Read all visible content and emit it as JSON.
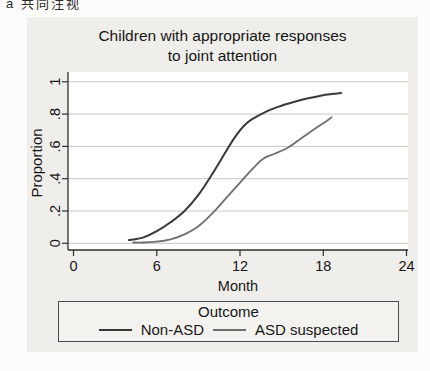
{
  "page": {
    "corner_label": "a 共同注视"
  },
  "figure": {
    "title_line1": "Children with appropriate responses",
    "title_line2": "to joint attention",
    "background": "#efeeea"
  },
  "chart_data": {
    "type": "line",
    "title": "Children with appropriate responses to joint attention",
    "xlabel": "Month",
    "ylabel": "Proportion",
    "xlim": [
      0,
      24
    ],
    "ylim": [
      0,
      1
    ],
    "x_ticks": [
      0,
      6,
      12,
      18,
      24
    ],
    "y_ticks": [
      0,
      0.2,
      0.4,
      0.6,
      0.8,
      1
    ],
    "y_tick_labels": [
      "0",
      ".2",
      ".4",
      ".6",
      ".8",
      "1"
    ],
    "grid": "horizontal",
    "grid_color": "#c6c6c3",
    "axis_color": "#2f2f2f",
    "legend": {
      "title": "Outcome",
      "position": "bottom"
    },
    "series": [
      {
        "name": "Non-ASD",
        "color": "#383838",
        "points": [
          [
            4,
            0.02
          ],
          [
            5,
            0.035
          ],
          [
            6,
            0.075
          ],
          [
            7,
            0.13
          ],
          [
            8,
            0.2
          ],
          [
            9,
            0.3
          ],
          [
            10,
            0.43
          ],
          [
            11,
            0.57
          ],
          [
            11.5,
            0.64
          ],
          [
            12,
            0.7
          ],
          [
            12.5,
            0.745
          ],
          [
            13,
            0.775
          ],
          [
            14,
            0.82
          ],
          [
            15,
            0.852
          ],
          [
            16,
            0.878
          ],
          [
            17,
            0.9
          ],
          [
            18,
            0.917
          ],
          [
            19,
            0.928
          ],
          [
            19.3,
            0.93
          ]
        ]
      },
      {
        "name": "ASD suspected",
        "color": "#6f6f6f",
        "points": [
          [
            4.3,
            0.005
          ],
          [
            5,
            0.005
          ],
          [
            6,
            0.01
          ],
          [
            7,
            0.025
          ],
          [
            8,
            0.055
          ],
          [
            9,
            0.105
          ],
          [
            10,
            0.185
          ],
          [
            11,
            0.28
          ],
          [
            12,
            0.375
          ],
          [
            13,
            0.47
          ],
          [
            13.7,
            0.525
          ],
          [
            14.5,
            0.555
          ],
          [
            15.5,
            0.595
          ],
          [
            16.5,
            0.655
          ],
          [
            17.5,
            0.715
          ],
          [
            18.2,
            0.755
          ],
          [
            18.6,
            0.78
          ]
        ]
      }
    ]
  }
}
